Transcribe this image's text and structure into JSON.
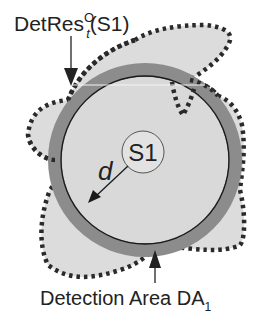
{
  "labels": {
    "top_main": "DetRes",
    "top_sup": "O",
    "top_sub": "t",
    "top_tail": "(S1)",
    "center": "S1",
    "distance": "d",
    "bottom_main": "Detection Area DA",
    "bottom_sub": "1"
  },
  "colors": {
    "background": "#ffffff",
    "detection_area_fill": "#dcdcdc",
    "ring": "#8c8c8c",
    "inner_fill": "#d9d9d9",
    "outline_dots": "#2a2a2a",
    "line": "#1a1a1a"
  }
}
